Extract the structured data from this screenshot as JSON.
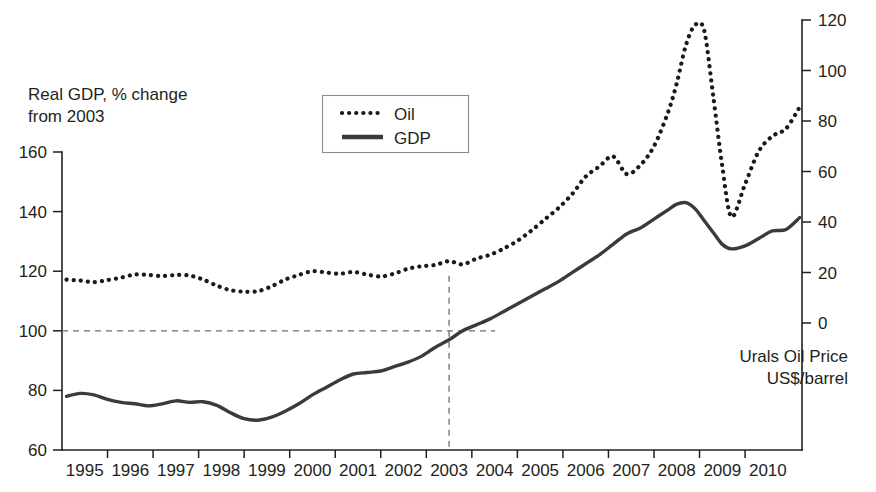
{
  "chart_data": {
    "type": "line",
    "title": "",
    "xlabel": "",
    "ylabel": "Real GDP, % change from 2003",
    "y2label": "Urals Oil Price US$/barrel",
    "grid": false,
    "legend_position": "top-center",
    "xlim": [
      1994.5,
      2010.75
    ],
    "ylim": [
      60,
      160
    ],
    "y2lim": [
      0,
      120
    ],
    "x_ticks": [
      "1995",
      "1996",
      "1997",
      "1998",
      "1999",
      "2000",
      "2001",
      "2002",
      "2003",
      "2004",
      "2005",
      "2006",
      "2007",
      "2008",
      "2009",
      "2010"
    ],
    "y_ticks": [
      "60",
      "80",
      "100",
      "120",
      "140",
      "160"
    ],
    "y2_ticks": [
      "0",
      "20",
      "40",
      "60",
      "80",
      "100",
      "120"
    ],
    "annotations": {
      "reference_hline_y": 100,
      "reference_vline_x": 2003
    },
    "series": [
      {
        "name": "Oil",
        "style": "dotted",
        "axis": "right",
        "units": "US$/barrel",
        "x": [
          1994.6,
          1994.9,
          1995.2,
          1995.5,
          1995.8,
          1996.1,
          1996.4,
          1996.7,
          1997.0,
          1997.3,
          1997.6,
          1997.9,
          1998.2,
          1998.5,
          1998.8,
          1999.1,
          1999.4,
          1999.7,
          2000.0,
          2000.3,
          2000.6,
          2000.9,
          2001.2,
          2001.5,
          2001.8,
          2002.1,
          2002.4,
          2002.7,
          2003.0,
          2003.3,
          2003.6,
          2003.9,
          2004.2,
          2004.5,
          2004.8,
          2005.1,
          2005.4,
          2005.7,
          2006.0,
          2006.3,
          2006.6,
          2006.9,
          2007.2,
          2007.5,
          2007.8,
          2008.0,
          2008.2,
          2008.4,
          2008.6,
          2008.8,
          2009.0,
          2009.2,
          2009.5,
          2009.8,
          2010.1,
          2010.4,
          2010.7
        ],
        "values": [
          17.2,
          16.8,
          16.2,
          17.0,
          18.0,
          19.2,
          19.0,
          18.6,
          19.0,
          18.8,
          17.2,
          14.8,
          13.0,
          12.4,
          12.6,
          14.5,
          17.2,
          19.0,
          20.5,
          20.0,
          19.5,
          20.2,
          19.2,
          18.4,
          19.6,
          21.5,
          22.5,
          23.0,
          24.5,
          23.2,
          25.5,
          27.0,
          29.5,
          32.5,
          36.5,
          41.0,
          45.5,
          51.0,
          58.0,
          62.0,
          66.0,
          59.0,
          62.5,
          70.0,
          83.0,
          95.0,
          110.0,
          118.0,
          116.0,
          90.0,
          62.0,
          42.0,
          55.0,
          68.0,
          74.0,
          77.0,
          85.5
        ]
      },
      {
        "name": "GDP",
        "style": "solid",
        "axis": "left",
        "units": "% of 2003",
        "x": [
          1994.6,
          1994.9,
          1995.2,
          1995.5,
          1995.8,
          1996.1,
          1996.4,
          1996.7,
          1997.0,
          1997.3,
          1997.6,
          1997.9,
          1998.2,
          1998.5,
          1998.8,
          1999.1,
          1999.4,
          1999.7,
          2000.0,
          2000.3,
          2000.6,
          2000.9,
          2001.2,
          2001.5,
          2001.8,
          2002.1,
          2002.4,
          2002.7,
          2003.0,
          2003.3,
          2003.6,
          2003.9,
          2004.2,
          2004.5,
          2004.8,
          2005.1,
          2005.4,
          2005.7,
          2006.0,
          2006.3,
          2006.6,
          2006.9,
          2007.2,
          2007.5,
          2007.8,
          2008.0,
          2008.2,
          2008.4,
          2008.6,
          2008.8,
          2009.0,
          2009.2,
          2009.5,
          2009.8,
          2010.1,
          2010.4,
          2010.7
        ],
        "values": [
          78.0,
          79.0,
          78.5,
          77.0,
          76.0,
          75.5,
          74.8,
          75.5,
          76.5,
          76.0,
          76.2,
          75.0,
          72.5,
          70.5,
          70.0,
          71.0,
          73.0,
          75.5,
          78.5,
          81.0,
          83.5,
          85.5,
          86.0,
          86.5,
          88.0,
          89.5,
          91.5,
          94.5,
          97.0,
          100.0,
          102.0,
          104.0,
          106.5,
          109.0,
          111.5,
          114.0,
          116.5,
          119.5,
          122.5,
          125.5,
          129.0,
          132.5,
          134.5,
          137.5,
          140.5,
          142.5,
          143.0,
          141.0,
          137.0,
          133.0,
          129.0,
          127.5,
          128.5,
          131.0,
          133.5,
          134.0,
          138.0
        ]
      }
    ]
  },
  "legend": {
    "items": [
      {
        "label": "Oil"
      },
      {
        "label": "GDP"
      }
    ]
  },
  "labels": {
    "left_axis_title_line1": "Real GDP, % change",
    "left_axis_title_line2": "from 2003",
    "right_axis_title_line1": "Urals Oil Price",
    "right_axis_title_line2": "US$/barrel"
  },
  "colors": {
    "ink": "#231f20",
    "gdp_line": "#3b3b3b",
    "oil_line": "#1a1a1a",
    "reference": "#6d6d6d",
    "legend_border": "#8a8a8a",
    "background": "#ffffff"
  }
}
